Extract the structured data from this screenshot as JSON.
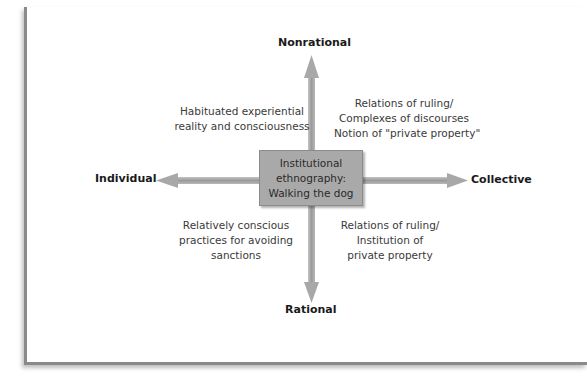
{
  "diagram": {
    "type": "quadrant-axes",
    "axes": {
      "top": "Nonrational",
      "bottom": "Rational",
      "left": "Individual",
      "right": "Collective"
    },
    "center": {
      "lines": [
        "Institutional",
        "ethnography:",
        "Walking the dog"
      ]
    },
    "quadrants": {
      "top_left": [
        "Habituated experiential",
        "reality and consciousness"
      ],
      "top_right": [
        "Relations of ruling/",
        "Complexes of discourses",
        "Notion of \"private property\""
      ],
      "bottom_left": [
        "Relatively conscious",
        "practices for avoiding",
        "sanctions"
      ],
      "bottom_right": [
        "Relations of ruling/",
        "Institution of",
        "private property"
      ]
    },
    "colors": {
      "arrow": "#a6a6a6",
      "box": "#a9a9a9",
      "frame": "#8a8a8a"
    }
  }
}
